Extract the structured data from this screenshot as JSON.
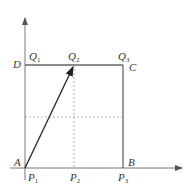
{
  "diagram": {
    "colors": {
      "line": "#666666",
      "arrow": "#333333",
      "dashed": "#999999",
      "text": "#333333"
    },
    "labels": {
      "D": "D",
      "C": "C",
      "A": "A",
      "B": "B",
      "Q1": {
        "base": "Q",
        "sub": "1"
      },
      "Q2": {
        "base": "Q",
        "sub": "2"
      },
      "Q3": {
        "base": "Q",
        "sub": "3"
      },
      "P1": {
        "base": "P",
        "sub": "1"
      },
      "P2": {
        "base": "P",
        "sub": "2"
      },
      "P3": {
        "base": "P",
        "sub": "3"
      }
    },
    "elements": [
      "x-axis with arrow",
      "y-axis with arrow",
      "square ABCD (sides DC and CB drawn)",
      "arrow from A(P1) to Q2",
      "dashed vertical line P2-Q2",
      "dashed horizontal midline"
    ]
  }
}
